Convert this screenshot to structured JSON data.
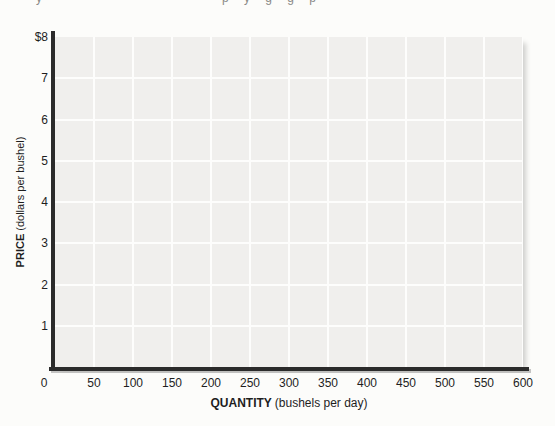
{
  "figure": {
    "top_cropped_fragments": [
      {
        "x": 36,
        "text": "y"
      },
      {
        "x": 222,
        "text": "p y g g p"
      }
    ]
  },
  "chart_data": {
    "type": "line",
    "title": "",
    "xlabel": "QUANTITY (bushels per day)",
    "xlabel_word": "QUANTITY",
    "xlabel_units": "(bushels per day)",
    "ylabel": "PRICE (dollars per bushel)",
    "ylabel_word": "PRICE",
    "ylabel_units": "(dollars per bushel)",
    "xlim": [
      0,
      600
    ],
    "ylim": [
      0,
      8
    ],
    "x_ticks": [
      0,
      50,
      100,
      150,
      200,
      250,
      300,
      350,
      400,
      450,
      500,
      550,
      600
    ],
    "x_tick_labels": [
      "0",
      "50",
      "100",
      "150",
      "200",
      "250",
      "300",
      "350",
      "400",
      "450",
      "500",
      "550",
      "600"
    ],
    "y_tick_values": [
      8,
      7,
      6,
      5,
      4,
      3,
      2,
      1
    ],
    "y_tick_labels": [
      "$8",
      "7",
      "6",
      "5",
      "4",
      "3",
      "2",
      "1"
    ],
    "grid": true,
    "legend": false,
    "series": []
  },
  "colors": {
    "page_bg": "#fcfcfa",
    "plot_bg": "#f0efed",
    "gridline": "#fdfdfc",
    "axis": "#2b2b2b",
    "text": "#1e1e1e",
    "fragment": "#8a8a88"
  }
}
